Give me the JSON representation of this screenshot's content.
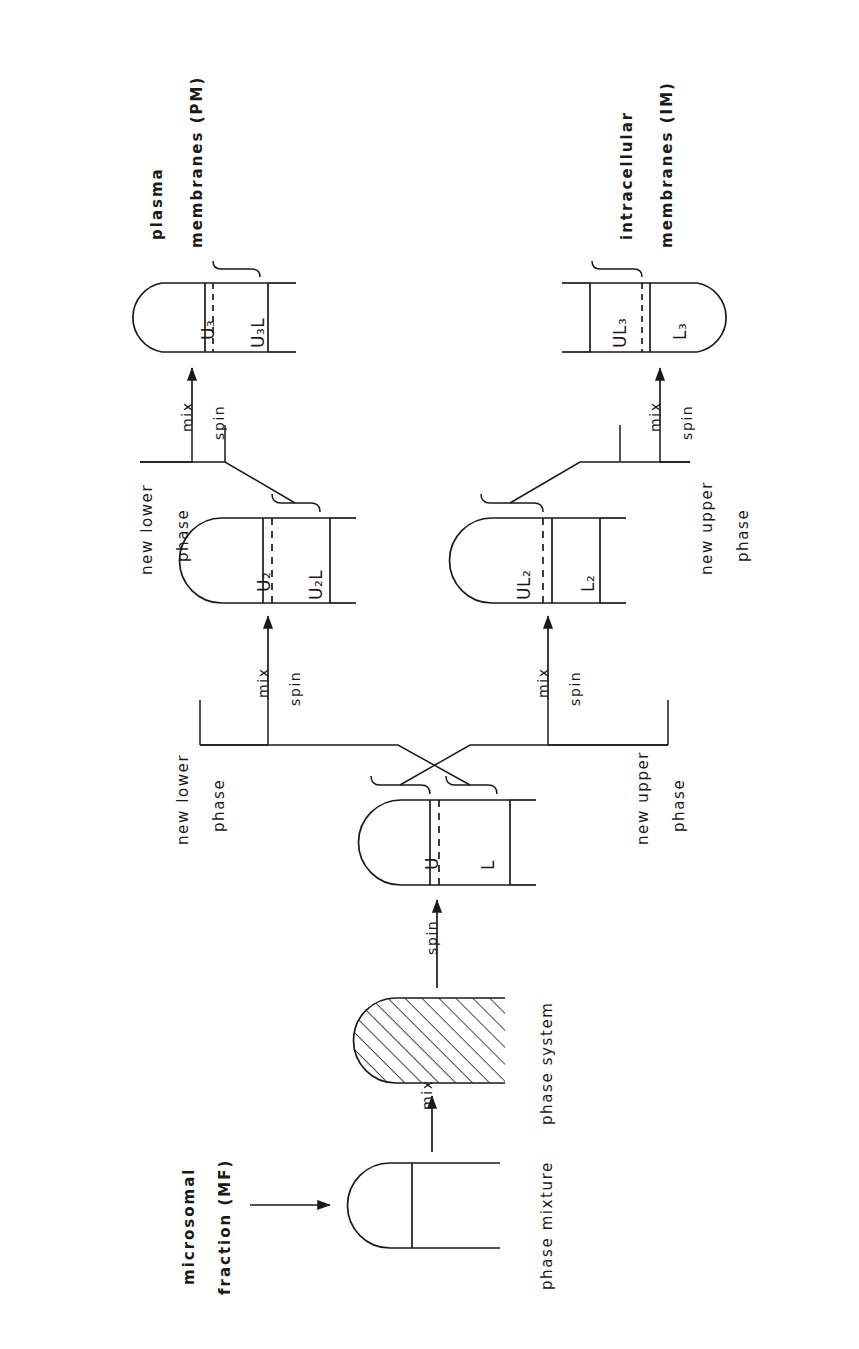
{
  "figure": {
    "type": "flow-diagram",
    "orientation": "rotated-90-ccw"
  },
  "inputs": {
    "source_label": "microsomal fraction (MF)",
    "arrow_icon": "right-arrow-icon"
  },
  "stage_captions": {
    "phase_mixture": "phase mixture",
    "phase_system": "phase system"
  },
  "outputs": {
    "plasma_membranes": "plasma membranes (PM)",
    "intracellular_membranes": "intracellular membranes (IM)"
  },
  "operations": {
    "mix": "mix",
    "spin": "spin"
  },
  "branch_labels": {
    "new_lower_phase_1": "new lower phase",
    "new_lower_phase_2": "new lower phase",
    "new_upper_phase_1": "new upper phase",
    "new_upper_phase_2": "new upper phase"
  },
  "tubes": [
    {
      "id": "tube-phase-mixture",
      "caption": "phase mixture",
      "compartments": [],
      "fill": "none",
      "divider": "solid"
    },
    {
      "id": "tube-phase-system",
      "caption": "phase system",
      "compartments": [],
      "fill": "hatched",
      "divider": "none"
    },
    {
      "id": "tube-UL",
      "compartments": [
        {
          "label": "U",
          "sub": "",
          "brace": true
        },
        {
          "label": "L",
          "sub": "",
          "brace": true
        }
      ],
      "divider": "dashed"
    },
    {
      "id": "tube-U2-U2L",
      "compartments": [
        {
          "label": "U",
          "sub": "2",
          "brace": true
        },
        {
          "label": "U",
          "sub": "2",
          "suffix": "L",
          "brace": false
        }
      ],
      "divider": "dashed"
    },
    {
      "id": "tube-UL2-L2",
      "compartments": [
        {
          "label": "UL",
          "sub": "2",
          "brace": false
        },
        {
          "label": "L",
          "sub": "2",
          "brace": true
        }
      ],
      "divider": "dashed"
    },
    {
      "id": "tube-U3-U3L",
      "compartments": [
        {
          "label": "U",
          "sub": "3",
          "brace": true
        },
        {
          "label": "U",
          "sub": "3",
          "suffix": "L",
          "brace": false
        }
      ],
      "divider": "dashed"
    },
    {
      "id": "tube-UL3-L3",
      "compartments": [
        {
          "label": "UL",
          "sub": "3",
          "brace": false
        },
        {
          "label": "L",
          "sub": "3",
          "brace": true
        }
      ],
      "divider": "dashed"
    }
  ],
  "tube_text": {
    "t_U": "U",
    "t_L": "L",
    "t_U2": "U₂",
    "t_U2L": "U₂L",
    "t_UL2": "UL₂",
    "t_L2": "L₂",
    "t_U3": "U₃",
    "t_U3L": "U₃L",
    "t_UL3": "UL₃",
    "t_L3": "L₃"
  },
  "colors": {
    "ink": "#1a1a1a",
    "background": "#ffffff"
  }
}
